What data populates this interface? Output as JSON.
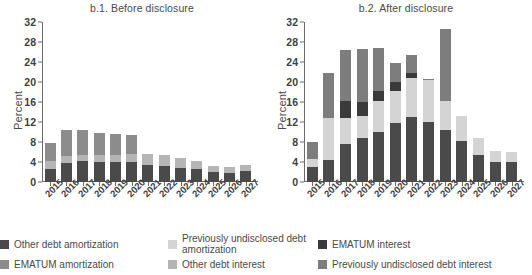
{
  "figure": {
    "ylabel": "Percent",
    "panels": [
      {
        "id": "b1",
        "title": "b.1. Before disclosure"
      },
      {
        "id": "b2",
        "title": "b.2. After disclosure"
      }
    ]
  },
  "legend": {
    "items": [
      {
        "label": "Other debt amortization",
        "color": "#4a4a4a",
        "name": "other-debt-amortization"
      },
      {
        "label": "EMATUM amortization",
        "color": "#8c8c8c",
        "name": "ematum-amortization"
      },
      {
        "label": "Previously undisclosed debt amortization",
        "color": "#d4d4d4",
        "name": "previously-undisclosed-debt-amortization"
      },
      {
        "label": "Other debt interest",
        "color": "#b5b5b5",
        "name": "other-debt-interest"
      },
      {
        "label": "EMATUM interest",
        "color": "#3a3a3a",
        "name": "ematum-interest"
      },
      {
        "label": "Previously undisclosed debt interest",
        "color": "#7d7d7d",
        "name": "previously-undisclosed-debt-interest"
      }
    ]
  },
  "chart_data": [
    {
      "type": "bar",
      "id": "b1",
      "title": "b.1. Before disclosure",
      "stacked": true,
      "xlabel": "",
      "ylabel": "Percent",
      "ylim": [
        0,
        32
      ],
      "yticks": [
        0,
        4,
        8,
        12,
        16,
        20,
        24,
        28,
        32
      ],
      "grid": false,
      "categories": [
        "2015",
        "2016",
        "2017",
        "2018",
        "2019",
        "2020",
        "2021",
        "2022",
        "2023",
        "2024",
        "2025",
        "2026",
        "2027"
      ],
      "series": [
        {
          "name": "Other debt amortization",
          "color": "#4a4a4a",
          "values": [
            2.6,
            3.8,
            4.2,
            4.1,
            4.0,
            4.1,
            3.5,
            3.3,
            2.8,
            2.6,
            2.0,
            1.9,
            2.2
          ]
        },
        {
          "name": "Other debt interest",
          "color": "#b5b5b5",
          "values": [
            1.6,
            1.5,
            1.2,
            1.3,
            1.4,
            1.5,
            2.1,
            2.2,
            2.0,
            1.6,
            1.2,
            1.2,
            1.3
          ]
        },
        {
          "name": "EMATUM amortization",
          "color": "#8c8c8c",
          "values": [
            3.6,
            5.1,
            5.1,
            4.5,
            4.2,
            3.8,
            0.0,
            0.0,
            0.0,
            0.0,
            0.0,
            0.0,
            0.0
          ]
        }
      ],
      "totals": [
        7.8,
        10.4,
        10.5,
        9.9,
        9.6,
        9.4,
        5.6,
        5.5,
        4.8,
        4.2,
        3.2,
        3.1,
        3.5
      ]
    },
    {
      "type": "bar",
      "id": "b2",
      "title": "b.2. After disclosure",
      "stacked": true,
      "xlabel": "",
      "ylabel": "Percent",
      "ylim": [
        0,
        32
      ],
      "yticks": [
        0,
        4,
        8,
        12,
        16,
        20,
        24,
        28,
        32
      ],
      "grid": false,
      "categories": [
        "2015",
        "2016",
        "2017",
        "2018",
        "2019",
        "2020",
        "2021",
        "2022",
        "2023",
        "2024",
        "2025",
        "2026",
        "2027"
      ],
      "series": [
        {
          "name": "Other debt amortization",
          "color": "#4a4a4a",
          "values": [
            3.0,
            4.5,
            7.7,
            8.9,
            10.1,
            11.8,
            13.0,
            12.0,
            10.4,
            8.2,
            5.5,
            4.0,
            4.0
          ]
        },
        {
          "name": "Previously undisclosed debt amortization",
          "color": "#d4d4d4",
          "values": [
            1.6,
            8.3,
            5.2,
            4.3,
            6.1,
            6.5,
            7.8,
            8.4,
            5.9,
            5.1,
            3.3,
            2.2,
            2.1
          ]
        },
        {
          "name": "EMATUM interest",
          "color": "#3a3a3a",
          "values": [
            0.0,
            0.0,
            3.3,
            2.8,
            2.0,
            1.7,
            1.1,
            0.0,
            0.0,
            0.0,
            0.0,
            0.0,
            0.0
          ]
        },
        {
          "name": "Previously undisclosed debt interest",
          "color": "#7d7d7d",
          "values": [
            3.5,
            9.1,
            10.2,
            10.6,
            8.7,
            3.8,
            3.6,
            0.3,
            14.3,
            0.0,
            0.0,
            0.0,
            0.0
          ]
        }
      ],
      "totals": [
        8.1,
        21.9,
        26.4,
        26.6,
        26.9,
        23.8,
        25.5,
        20.7,
        30.6,
        13.3,
        8.8,
        6.2,
        6.1
      ]
    }
  ]
}
